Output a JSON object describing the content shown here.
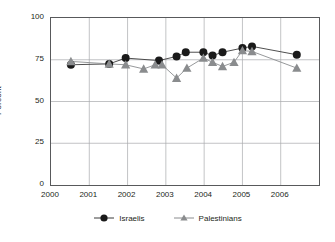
{
  "chart_data": {
    "type": "line",
    "title": "",
    "xlabel": "",
    "ylabel": "Percent",
    "xlim": [
      2000,
      2007
    ],
    "ylim": [
      0,
      100
    ],
    "grid": true,
    "legend_position": "bottom",
    "y_ticks": [
      "0",
      "25",
      "50",
      "75",
      "100"
    ],
    "y_tick_values": [
      0,
      25,
      50,
      75,
      100
    ],
    "x_ticks": [
      "2000",
      "2001",
      "2002",
      "2003",
      "2004",
      "2005",
      "2006"
    ],
    "x_tick_values": [
      2000,
      2001,
      2002,
      2003,
      2004,
      2005,
      2006
    ],
    "series": [
      {
        "name": "Israelis",
        "marker": "circle",
        "color": "#1a1a1a",
        "points": [
          {
            "x": 2000.52,
            "y": 72
          },
          {
            "x": 2001.52,
            "y": 72.5
          },
          {
            "x": 2001.95,
            "y": 76
          },
          {
            "x": 2002.82,
            "y": 74.5
          },
          {
            "x": 2003.28,
            "y": 77
          },
          {
            "x": 2003.52,
            "y": 79.5
          },
          {
            "x": 2003.98,
            "y": 79.5
          },
          {
            "x": 2004.22,
            "y": 77.5
          },
          {
            "x": 2004.48,
            "y": 79.5
          },
          {
            "x": 2005.0,
            "y": 82
          },
          {
            "x": 2005.25,
            "y": 83
          },
          {
            "x": 2006.42,
            "y": 78
          }
        ]
      },
      {
        "name": "Palestinians",
        "marker": "triangle",
        "color": "#8a8c8e",
        "points": [
          {
            "x": 2000.52,
            "y": 74
          },
          {
            "x": 2001.52,
            "y": 72.5
          },
          {
            "x": 2001.95,
            "y": 72
          },
          {
            "x": 2002.42,
            "y": 69.5
          },
          {
            "x": 2002.72,
            "y": 72
          },
          {
            "x": 2002.9,
            "y": 72
          },
          {
            "x": 2003.28,
            "y": 64
          },
          {
            "x": 2003.55,
            "y": 70
          },
          {
            "x": 2003.98,
            "y": 76
          },
          {
            "x": 2004.22,
            "y": 73.5
          },
          {
            "x": 2004.48,
            "y": 71
          },
          {
            "x": 2004.78,
            "y": 73.5
          },
          {
            "x": 2005.0,
            "y": 80.5
          },
          {
            "x": 2005.25,
            "y": 80
          },
          {
            "x": 2006.42,
            "y": 70
          }
        ]
      }
    ]
  },
  "legend": {
    "items": [
      {
        "label": "Israelis"
      },
      {
        "label": "Palestinians"
      }
    ]
  }
}
